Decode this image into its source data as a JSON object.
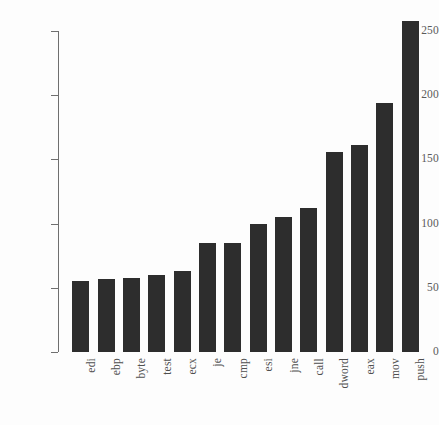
{
  "chart_data": {
    "type": "bar",
    "title": "",
    "subtitle": "",
    "xlabel": "",
    "ylabel": "",
    "categories": [
      "edi",
      "ebp",
      "byte",
      "test",
      "ecx",
      "je",
      "cmp",
      "esi",
      "jne",
      "call",
      "dword",
      "eax",
      "mov",
      "push"
    ],
    "values": [
      55,
      57,
      58,
      60,
      63,
      85,
      85,
      100,
      105,
      112,
      156,
      161,
      194,
      258
    ],
    "ylim": [
      0,
      250
    ],
    "yticks": [
      0,
      50,
      100,
      150,
      200,
      250
    ],
    "ytick_labels": [
      "0",
      "50",
      "100",
      "150",
      "200",
      "250"
    ],
    "grid": false,
    "legend": null,
    "bar_color": "#2d2d2d",
    "axis_color": "#6f6f6f",
    "background_color": "#fdfdfd",
    "xtick_rotation": -90,
    "annotations": []
  }
}
